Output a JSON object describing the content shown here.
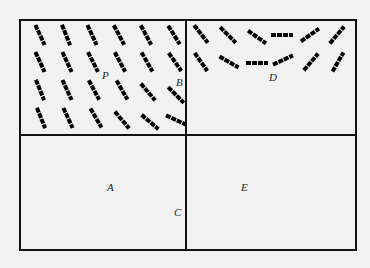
{
  "figure": {
    "width": 370,
    "height": 268,
    "background": "#f1f1f1",
    "frame": {
      "x": 20,
      "y": 20,
      "w": 336,
      "h": 230,
      "stroke": "#111",
      "stroke_width": 2
    },
    "dividers": {
      "vertical_x": 186,
      "horizontal_y": 135
    },
    "segment_length": 22,
    "segment_width": 4,
    "segment_color": "#000"
  },
  "panels": [
    {
      "name": "top-left",
      "segments": [
        {
          "x": 40,
          "y": 35,
          "angle": 65
        },
        {
          "x": 66,
          "y": 35,
          "angle": 68
        },
        {
          "x": 92,
          "y": 35,
          "angle": 65
        },
        {
          "x": 119,
          "y": 35,
          "angle": 62
        },
        {
          "x": 146,
          "y": 35,
          "angle": 62
        },
        {
          "x": 174,
          "y": 35,
          "angle": 58
        },
        {
          "x": 40,
          "y": 62,
          "angle": 65
        },
        {
          "x": 67,
          "y": 62,
          "angle": 65
        },
        {
          "x": 93,
          "y": 62,
          "angle": 63
        },
        {
          "x": 120,
          "y": 62,
          "angle": 62
        },
        {
          "x": 147,
          "y": 62,
          "angle": 60
        },
        {
          "x": 175,
          "y": 62,
          "angle": 55
        },
        {
          "x": 40,
          "y": 90,
          "angle": 68
        },
        {
          "x": 67,
          "y": 90,
          "angle": 65
        },
        {
          "x": 94,
          "y": 90,
          "angle": 62
        },
        {
          "x": 122,
          "y": 90,
          "angle": 60
        },
        {
          "x": 148,
          "y": 92,
          "angle": 50
        },
        {
          "x": 176,
          "y": 95,
          "angle": 45
        },
        {
          "x": 41,
          "y": 118,
          "angle": 68
        },
        {
          "x": 68,
          "y": 118,
          "angle": 65
        },
        {
          "x": 96,
          "y": 118,
          "angle": 60
        },
        {
          "x": 122,
          "y": 120,
          "angle": 50
        },
        {
          "x": 150,
          "y": 122,
          "angle": 40
        },
        {
          "x": 176,
          "y": 120,
          "angle": 25
        }
      ]
    },
    {
      "name": "top-right",
      "segments": [
        {
          "x": 201,
          "y": 34,
          "angle": 52
        },
        {
          "x": 228,
          "y": 35,
          "angle": 45
        },
        {
          "x": 257,
          "y": 37,
          "angle": 35
        },
        {
          "x": 282,
          "y": 35,
          "angle": 0
        },
        {
          "x": 310,
          "y": 35,
          "angle": -35
        },
        {
          "x": 337,
          "y": 35,
          "angle": -50
        },
        {
          "x": 201,
          "y": 62,
          "angle": 55
        },
        {
          "x": 229,
          "y": 62,
          "angle": 30
        },
        {
          "x": 257,
          "y": 63,
          "angle": 0
        },
        {
          "x": 283,
          "y": 60,
          "angle": -25
        },
        {
          "x": 311,
          "y": 62,
          "angle": -50
        },
        {
          "x": 338,
          "y": 62,
          "angle": -60
        }
      ]
    }
  ],
  "labels": [
    {
      "text": "P",
      "x": 102,
      "y": 79
    },
    {
      "text": "B",
      "x": 176,
      "y": 86
    },
    {
      "text": "D",
      "x": 269,
      "y": 81
    },
    {
      "text": "A",
      "x": 107,
      "y": 191
    },
    {
      "text": "C",
      "x": 174,
      "y": 216
    },
    {
      "text": "E",
      "x": 241,
      "y": 191
    }
  ]
}
